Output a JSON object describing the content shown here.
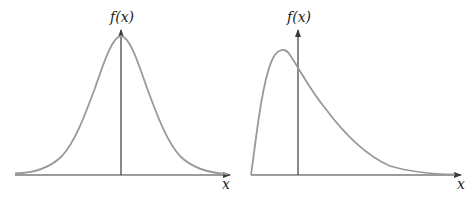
{
  "panels": [
    {
      "id": "symmetric",
      "description": "Symmetric bell-shaped density (normal)",
      "y_axis_label": "f(x)",
      "x_axis_label": "x",
      "colors": {
        "axis": "#3a3a3a",
        "curve": "#9a9a9a"
      }
    },
    {
      "id": "right-skewed",
      "description": "Right-skewed density",
      "y_axis_label": "f(x)",
      "x_axis_label": "x",
      "colors": {
        "axis": "#3a3a3a",
        "curve": "#9a9a9a"
      }
    }
  ]
}
